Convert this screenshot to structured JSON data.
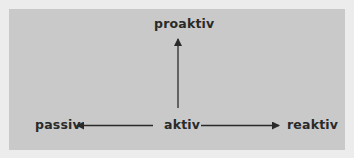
{
  "diagram": {
    "type": "concept-axes",
    "nodes": {
      "center": "aktiv",
      "top": "proaktiv",
      "left": "passiv",
      "right": "reaktiv"
    },
    "edges": [
      {
        "from": "aktiv",
        "to": "proaktiv",
        "direction": "up"
      },
      {
        "from": "aktiv",
        "to": "passiv",
        "direction": "left"
      },
      {
        "from": "aktiv",
        "to": "reaktiv",
        "direction": "right"
      }
    ],
    "colors": {
      "background": "#ececec",
      "panel": "#c9c9c9",
      "text": "#2a2a2a",
      "arrow": "#2a2a2a"
    }
  }
}
